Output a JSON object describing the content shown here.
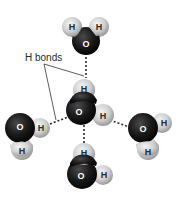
{
  "diagram": {
    "callout": {
      "label": "H bonds"
    },
    "atoms": {
      "hydrogen_symbol": "H",
      "oxygen_symbol": "O"
    },
    "colors": {
      "oxygen": "#1a1a1a",
      "hydrogen": "#d4d4d4",
      "bond_line": "#2a2a2a",
      "background": "#ffffff"
    },
    "molecules": [
      {
        "name": "top-water",
        "atoms": [
          "H",
          "H",
          "O"
        ]
      },
      {
        "name": "center-water",
        "atoms": [
          "H",
          "O",
          "H"
        ]
      },
      {
        "name": "left-water",
        "atoms": [
          "O",
          "H",
          "H"
        ]
      },
      {
        "name": "right-water",
        "atoms": [
          "O",
          "H",
          "H"
        ]
      },
      {
        "name": "bottom-water",
        "atoms": [
          "H",
          "O",
          "H"
        ]
      }
    ]
  }
}
